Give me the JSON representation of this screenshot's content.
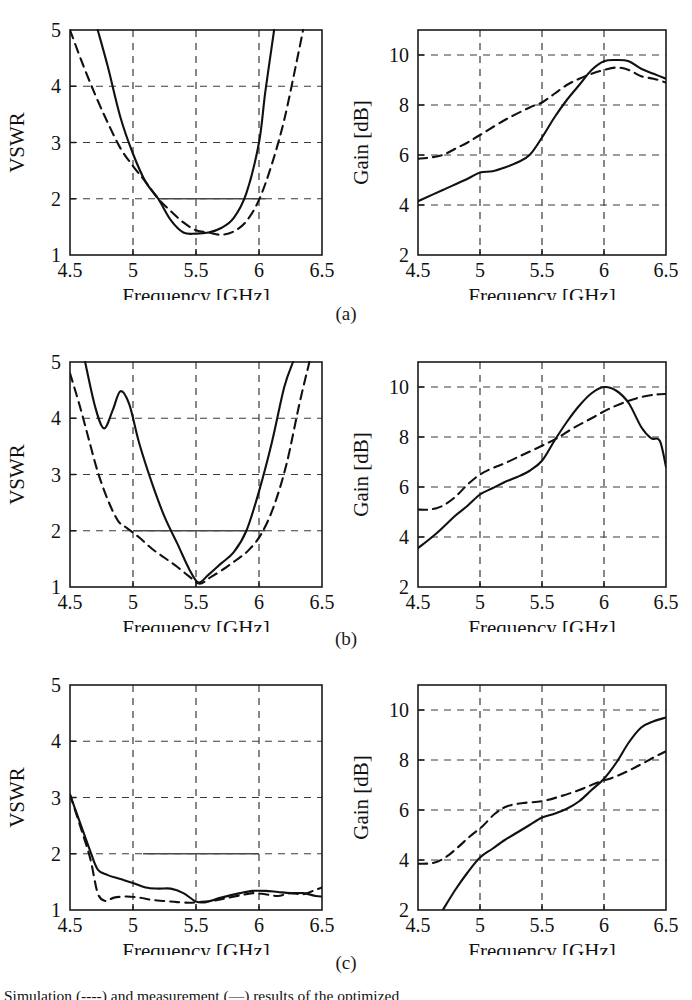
{
  "figure": {
    "subplot_labels": [
      "(a)",
      "(b)",
      "(c)"
    ],
    "caption": "Simulation (----) and measurement (—) results of the optimized"
  },
  "axes_common": {
    "x_label": "Frequency [GHz]",
    "x_ticks": [
      "4.5",
      "5",
      "5.5",
      "6",
      "6.5"
    ],
    "x_range": [
      4.5,
      6.5
    ],
    "vswr_label": "VSWR",
    "vswr_ticks": [
      "1",
      "2",
      "3",
      "4",
      "5"
    ],
    "vswr_range": [
      1,
      5
    ],
    "gain_label": "Gain [dB]",
    "gain_ticks": [
      "2",
      "4",
      "6",
      "8",
      "10"
    ],
    "gain_range": [
      2,
      11
    ],
    "series_names": [
      "measured-solid",
      "simulated-dashed"
    ],
    "curve_color": "#111111",
    "grid_color": "#3a3a3a"
  },
  "chart_data": [
    {
      "id": "a-vswr",
      "type": "line",
      "title": "",
      "xlabel": "Frequency [GHz]",
      "ylabel": "VSWR",
      "xlim": [
        4.5,
        6.5
      ],
      "ylim": [
        1,
        5
      ],
      "xticks": [
        4.5,
        5,
        5.5,
        6,
        6.5
      ],
      "yticks": [
        1,
        2,
        3,
        4,
        5
      ],
      "grid": true,
      "annotations": [
        "horizontal reference line at VSWR = 2 from 5.2 to 6.05 GHz"
      ],
      "series": [
        {
          "name": "measured-solid",
          "style": "solid",
          "x": [
            4.72,
            4.8,
            4.9,
            5.0,
            5.1,
            5.2,
            5.3,
            5.4,
            5.5,
            5.6,
            5.7,
            5.8,
            5.9,
            6.0,
            6.05,
            6.12
          ],
          "y": [
            5.0,
            4.35,
            3.45,
            2.8,
            2.3,
            2.0,
            1.62,
            1.4,
            1.38,
            1.4,
            1.48,
            1.66,
            2.1,
            3.0,
            3.9,
            5.0
          ]
        },
        {
          "name": "simulated-dashed",
          "style": "dashed",
          "x": [
            4.5,
            4.6,
            4.7,
            4.8,
            4.9,
            5.0,
            5.1,
            5.2,
            5.3,
            5.4,
            5.5,
            5.6,
            5.7,
            5.8,
            5.9,
            6.0,
            6.1,
            6.2,
            6.3,
            6.35
          ],
          "y": [
            5.0,
            4.4,
            3.85,
            3.35,
            2.9,
            2.58,
            2.3,
            2.0,
            1.78,
            1.58,
            1.44,
            1.4,
            1.36,
            1.42,
            1.6,
            1.98,
            2.6,
            3.4,
            4.45,
            5.0
          ]
        }
      ]
    },
    {
      "id": "a-gain",
      "type": "line",
      "title": "",
      "xlabel": "Frequency [GHz]",
      "ylabel": "Gain [dB]",
      "xlim": [
        4.5,
        6.5
      ],
      "ylim": [
        2,
        11
      ],
      "xticks": [
        4.5,
        5,
        5.5,
        6,
        6.5
      ],
      "yticks": [
        2,
        4,
        6,
        8,
        10
      ],
      "grid": true,
      "series": [
        {
          "name": "measured-solid",
          "style": "solid",
          "x": [
            4.5,
            4.7,
            4.9,
            5.0,
            5.1,
            5.2,
            5.3,
            5.4,
            5.5,
            5.6,
            5.7,
            5.8,
            5.9,
            6.0,
            6.1,
            6.2,
            6.3,
            6.4,
            6.5
          ],
          "y": [
            4.15,
            4.6,
            5.05,
            5.3,
            5.35,
            5.5,
            5.7,
            6.0,
            6.7,
            7.5,
            8.2,
            8.8,
            9.4,
            9.75,
            9.8,
            9.75,
            9.45,
            9.25,
            9.05
          ]
        },
        {
          "name": "simulated-dashed",
          "style": "dashed",
          "x": [
            4.5,
            4.6,
            4.7,
            4.8,
            4.9,
            5.0,
            5.2,
            5.4,
            5.5,
            5.6,
            5.7,
            5.8,
            5.9,
            6.0,
            6.1,
            6.2,
            6.3,
            6.4,
            6.5
          ],
          "y": [
            5.85,
            5.9,
            6.0,
            6.25,
            6.5,
            6.8,
            7.4,
            7.9,
            8.1,
            8.45,
            8.8,
            9.05,
            9.25,
            9.4,
            9.5,
            9.4,
            9.15,
            9.05,
            8.9
          ]
        }
      ]
    },
    {
      "id": "b-vswr",
      "type": "line",
      "title": "",
      "xlabel": "Frequency [GHz]",
      "ylabel": "VSWR",
      "xlim": [
        4.5,
        6.5
      ],
      "ylim": [
        1,
        5
      ],
      "xticks": [
        4.5,
        5,
        5.5,
        6,
        6.5
      ],
      "yticks": [
        1,
        2,
        3,
        4,
        5
      ],
      "grid": true,
      "annotations": [
        "horizontal reference line at VSWR = 2 from 5.0 to 6.05 GHz"
      ],
      "series": [
        {
          "name": "measured-solid",
          "style": "solid",
          "x": [
            4.62,
            4.7,
            4.77,
            4.84,
            4.9,
            4.97,
            5.05,
            5.15,
            5.25,
            5.35,
            5.45,
            5.52,
            5.6,
            5.7,
            5.8,
            5.9,
            6.0,
            6.1,
            6.2,
            6.27
          ],
          "y": [
            5.0,
            4.2,
            3.82,
            4.15,
            4.48,
            4.25,
            3.55,
            2.85,
            2.25,
            1.78,
            1.3,
            1.08,
            1.22,
            1.42,
            1.62,
            2.0,
            2.7,
            3.55,
            4.55,
            5.0
          ]
        },
        {
          "name": "simulated-dashed",
          "style": "dashed",
          "x": [
            4.5,
            4.58,
            4.65,
            4.72,
            4.8,
            4.88,
            4.95,
            5.05,
            5.15,
            5.25,
            5.35,
            5.45,
            5.53,
            5.62,
            5.72,
            5.82,
            5.92,
            6.02,
            6.12,
            6.22,
            6.32,
            6.4
          ],
          "y": [
            4.8,
            4.2,
            3.62,
            3.05,
            2.55,
            2.18,
            2.05,
            1.88,
            1.68,
            1.52,
            1.36,
            1.18,
            1.06,
            1.18,
            1.32,
            1.48,
            1.66,
            1.95,
            2.45,
            3.2,
            4.25,
            5.0
          ]
        }
      ]
    },
    {
      "id": "b-gain",
      "type": "line",
      "title": "",
      "xlabel": "Frequency [GHz]",
      "ylabel": "Gain [dB]",
      "xlim": [
        4.5,
        6.5
      ],
      "ylim": [
        2,
        11
      ],
      "xticks": [
        4.5,
        5,
        5.5,
        6,
        6.5
      ],
      "yticks": [
        2,
        4,
        6,
        8,
        10
      ],
      "grid": true,
      "series": [
        {
          "name": "measured-solid",
          "style": "solid",
          "x": [
            4.5,
            4.65,
            4.8,
            4.9,
            5.0,
            5.1,
            5.2,
            5.3,
            5.4,
            5.5,
            5.6,
            5.7,
            5.8,
            5.9,
            6.0,
            6.1,
            6.2,
            6.3,
            6.38,
            6.45,
            6.5
          ],
          "y": [
            3.55,
            4.15,
            4.85,
            5.25,
            5.7,
            5.95,
            6.2,
            6.4,
            6.65,
            7.05,
            7.85,
            8.6,
            9.25,
            9.75,
            10.0,
            9.85,
            9.35,
            8.4,
            7.95,
            7.85,
            6.8
          ]
        },
        {
          "name": "simulated-dashed",
          "style": "dashed",
          "x": [
            4.5,
            4.6,
            4.7,
            4.8,
            4.9,
            5.0,
            5.1,
            5.2,
            5.35,
            5.5,
            5.62,
            5.75,
            5.9,
            6.05,
            6.2,
            6.32,
            6.42,
            6.5
          ],
          "y": [
            5.1,
            5.1,
            5.25,
            5.6,
            6.1,
            6.5,
            6.75,
            6.95,
            7.3,
            7.65,
            7.95,
            8.35,
            8.75,
            9.15,
            9.45,
            9.62,
            9.7,
            9.72
          ]
        }
      ]
    },
    {
      "id": "c-vswr",
      "type": "line",
      "title": "",
      "xlabel": "Frequency [GHz]",
      "ylabel": "VSWR",
      "xlim": [
        4.5,
        6.5
      ],
      "ylim": [
        1,
        5
      ],
      "xticks": [
        4.5,
        5,
        5.5,
        6,
        6.5
      ],
      "yticks": [
        1,
        2,
        3,
        4,
        5
      ],
      "grid": true,
      "annotations": [
        "horizontal reference line at VSWR = 2 from 5.08 to 6.0 GHz"
      ],
      "series": [
        {
          "name": "measured-solid",
          "style": "solid",
          "x": [
            4.5,
            4.58,
            4.66,
            4.72,
            4.8,
            4.9,
            5.0,
            5.1,
            5.2,
            5.3,
            5.4,
            5.5,
            5.58,
            5.7,
            5.85,
            5.95,
            6.05,
            6.15,
            6.25,
            6.35,
            6.45,
            6.5
          ],
          "y": [
            3.05,
            2.55,
            2.05,
            1.72,
            1.62,
            1.55,
            1.48,
            1.4,
            1.38,
            1.38,
            1.3,
            1.15,
            1.14,
            1.22,
            1.3,
            1.34,
            1.34,
            1.32,
            1.3,
            1.3,
            1.25,
            1.24
          ]
        },
        {
          "name": "simulated-dashed",
          "style": "dashed",
          "x": [
            4.5,
            4.58,
            4.66,
            4.72,
            4.78,
            4.85,
            4.95,
            5.05,
            5.15,
            5.25,
            5.35,
            5.45,
            5.52,
            5.62,
            5.72,
            5.85,
            5.95,
            6.05,
            6.15,
            6.25,
            6.35,
            6.45,
            6.5
          ],
          "y": [
            3.05,
            2.5,
            1.92,
            1.3,
            1.16,
            1.22,
            1.24,
            1.22,
            1.18,
            1.16,
            1.14,
            1.13,
            1.14,
            1.16,
            1.2,
            1.26,
            1.3,
            1.28,
            1.25,
            1.3,
            1.28,
            1.36,
            1.4
          ]
        }
      ]
    },
    {
      "id": "c-gain",
      "type": "line",
      "title": "",
      "xlabel": "Frequency [GHz]",
      "ylabel": "Gain [dB]",
      "xlim": [
        4.5,
        6.5
      ],
      "ylim": [
        2,
        11
      ],
      "xticks": [
        4.5,
        5,
        5.5,
        6,
        6.5
      ],
      "yticks": [
        2,
        4,
        6,
        8,
        10
      ],
      "grid": true,
      "series": [
        {
          "name": "measured-solid",
          "style": "solid",
          "x": [
            4.7,
            4.8,
            4.9,
            5.0,
            5.1,
            5.2,
            5.3,
            5.4,
            5.5,
            5.6,
            5.7,
            5.8,
            5.9,
            6.0,
            6.1,
            6.2,
            6.3,
            6.4,
            6.5
          ],
          "y": [
            2.0,
            2.8,
            3.5,
            4.1,
            4.45,
            4.8,
            5.1,
            5.4,
            5.7,
            5.85,
            6.05,
            6.35,
            6.8,
            7.25,
            7.9,
            8.7,
            9.3,
            9.55,
            9.7
          ]
        },
        {
          "name": "simulated-dashed",
          "style": "dashed",
          "x": [
            4.5,
            4.62,
            4.72,
            4.82,
            4.92,
            5.02,
            5.12,
            5.22,
            5.35,
            5.5,
            5.65,
            5.8,
            5.95,
            6.1,
            6.25,
            6.4,
            6.5
          ],
          "y": [
            3.85,
            3.88,
            4.1,
            4.5,
            4.95,
            5.35,
            5.85,
            6.15,
            6.28,
            6.35,
            6.55,
            6.8,
            7.1,
            7.35,
            7.7,
            8.1,
            8.35
          ]
        }
      ]
    }
  ]
}
